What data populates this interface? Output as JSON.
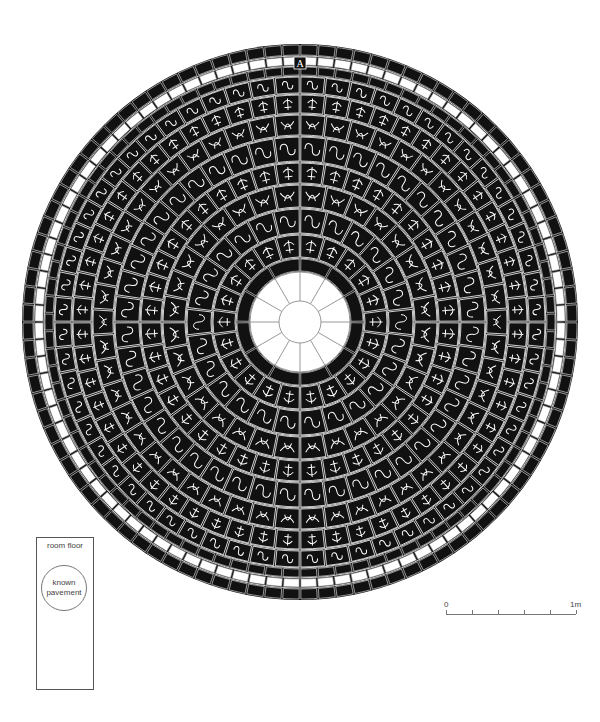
{
  "figure": {
    "center": {
      "x": 300,
      "y": 322
    },
    "colors": {
      "ink": "#111111",
      "paper": "#ffffff",
      "line": "#777777"
    },
    "rings": [
      {
        "name": "outer-border",
        "r_outer": 278,
        "r_inner": 266,
        "type": "black-tiles",
        "count": 96
      },
      {
        "name": "white-band",
        "r_outer": 266,
        "r_inner": 256,
        "type": "white-tiles",
        "count": 96
      },
      {
        "name": "black-band-2",
        "r_outer": 256,
        "r_inner": 246,
        "type": "black-tiles",
        "count": 90
      },
      {
        "name": "scroll-ring-1",
        "r_outer": 246,
        "r_inner": 228,
        "type": "ornament",
        "count": 60
      },
      {
        "name": "scroll-ring-2",
        "r_outer": 228,
        "r_inner": 208,
        "type": "ornament",
        "count": 56
      },
      {
        "name": "scroll-ring-3",
        "r_outer": 208,
        "r_inner": 186,
        "type": "ornament",
        "count": 50
      },
      {
        "name": "fleur-ring-1",
        "r_outer": 186,
        "r_inner": 160,
        "type": "ornament",
        "count": 44
      },
      {
        "name": "leaf-ring",
        "r_outer": 160,
        "r_inner": 138,
        "type": "ornament",
        "count": 40
      },
      {
        "name": "fleur-ring-2",
        "r_outer": 138,
        "r_inner": 114,
        "type": "ornament",
        "count": 32
      },
      {
        "name": "knot-ring",
        "r_outer": 114,
        "r_inner": 88,
        "type": "ornament",
        "count": 26
      },
      {
        "name": "scroll-ring-inner",
        "r_outer": 88,
        "r_inner": 64,
        "type": "ornament",
        "count": 22
      },
      {
        "name": "inner-black-band",
        "r_outer": 64,
        "r_inner": 50,
        "type": "black-tiles",
        "count": 12
      },
      {
        "name": "center-rosette",
        "r_outer": 50,
        "r_inner": 0,
        "type": "rosette",
        "count": 12
      }
    ],
    "top_marker": "A"
  },
  "legend": {
    "title": "room floor",
    "circle_label_line1": "known",
    "circle_label_line2": "pavement"
  },
  "scale_bar": {
    "start_label": "0",
    "end_label": "1m",
    "divisions": 5
  }
}
